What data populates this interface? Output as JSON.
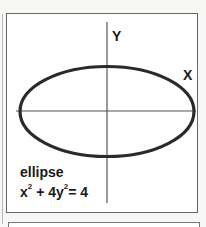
{
  "diagram": {
    "axis_labels": {
      "y": "Y",
      "x": "X"
    },
    "curve_name": "ellipse",
    "equation": {
      "term1_base": "x",
      "term1_exp": "2",
      "plus": " + 4y",
      "term2_exp": "2",
      "rhs": "= 4",
      "full": "x^2 + 4y^2 = 4"
    },
    "colors": {
      "curve": "#2a2a2a",
      "axes": "#555555",
      "frame": "#666666"
    }
  }
}
